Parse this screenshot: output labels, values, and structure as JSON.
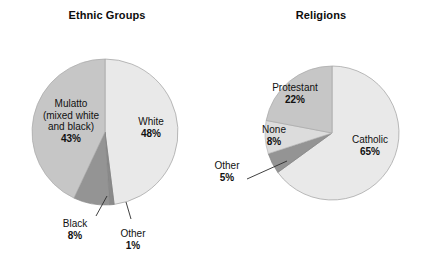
{
  "figure": {
    "background": "#ffffff",
    "width": 428,
    "height": 272
  },
  "charts": [
    {
      "id": "ethnic-groups",
      "title": "Ethnic Groups",
      "center": {
        "x": 105,
        "y": 132
      },
      "radius": 73
    },
    {
      "id": "religions",
      "title": "Religions",
      "center": {
        "x": 332,
        "y": 133
      },
      "radius": 67
    }
  ],
  "labels": {
    "ethnic": {
      "white_name": "White",
      "white_pct": "48%",
      "mulatto_line1": "Mulatto",
      "mulatto_line2": "(mixed white",
      "mulatto_line3": "and black)",
      "mulatto_pct": "43%",
      "black_name": "Black",
      "black_pct": "8%",
      "other_name": "Other",
      "other_pct": "1%"
    },
    "religions": {
      "catholic_name": "Catholic",
      "catholic_pct": "65%",
      "protestant_name": "Protestant",
      "protestant_pct": "22%",
      "none_name": "None",
      "none_pct": "8%",
      "other_name": "Other",
      "other_pct": "5%"
    }
  },
  "colors": {
    "very_light_gray": "#e9e9e9",
    "light_gray": "#e2e2e2",
    "medium_gray": "#c6c6c6",
    "medium_dark_gray": "#b0b0b0",
    "dark_gray": "#949494",
    "darker_gray": "#8a8a8a",
    "outline": "#7a7a7a",
    "leader_line": "#2b2b2b",
    "text": "#111111"
  },
  "chart_data": [
    {
      "type": "pie",
      "title": "Ethnic Groups",
      "categories": [
        "White",
        "Mulatto (mixed white and black)",
        "Black",
        "Other"
      ],
      "values": [
        48,
        43,
        8,
        1
      ],
      "value_labels": [
        "48%",
        "43%",
        "8%",
        "1%"
      ],
      "unit": "percent",
      "start_angle_deg": 0,
      "direction": "clockwise",
      "slice_colors": [
        "#e9e9e9",
        "#c6c6c6",
        "#949494",
        "#8a8a8a"
      ],
      "legend": "none",
      "annotations": [
        {
          "text": "Black 8%",
          "leader_line": true
        },
        {
          "text": "Other 1%",
          "leader_line": true
        }
      ]
    },
    {
      "type": "pie",
      "title": "Religions",
      "categories": [
        "Catholic",
        "Protestant",
        "None",
        "Other"
      ],
      "values": [
        65,
        22,
        8,
        5
      ],
      "value_labels": [
        "65%",
        "22%",
        "8%",
        "5%"
      ],
      "unit": "percent",
      "start_angle_deg": 0,
      "direction": "clockwise",
      "slice_colors": [
        "#e9e9e9",
        "#c6c6c6",
        "#dcdcdc",
        "#949494"
      ],
      "legend": "none",
      "annotations": [
        {
          "text": "Other 5%",
          "leader_line": true
        }
      ]
    }
  ]
}
